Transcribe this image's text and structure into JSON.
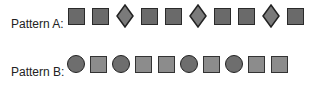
{
  "pattern_a": {
    "label": "Pattern A:",
    "shapes": [
      "square",
      "square",
      "diamond",
      "square",
      "square",
      "diamond",
      "square",
      "square",
      "diamond",
      "square"
    ]
  },
  "pattern_b": {
    "label": "Pattern B:",
    "shapes": [
      "circle",
      "square",
      "circle",
      "square",
      "square",
      "circle",
      "square",
      "circle",
      "square",
      "square"
    ]
  },
  "colors": {
    "square_a_fill": "#6a6a6a",
    "diamond_fill": "#7a7a7a",
    "circle_fill": "#6e6e6e",
    "square_b_fill": "#8c8c8c",
    "outline": "#222222"
  }
}
